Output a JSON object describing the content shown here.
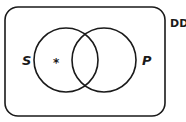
{
  "diagram": {
    "type": "venn",
    "universe_label": "DD",
    "sets": [
      {
        "label": "S",
        "marker": "*"
      },
      {
        "label": "P"
      }
    ],
    "colors": {
      "stroke": "#1a1a1a",
      "background": "#ffffff"
    }
  }
}
